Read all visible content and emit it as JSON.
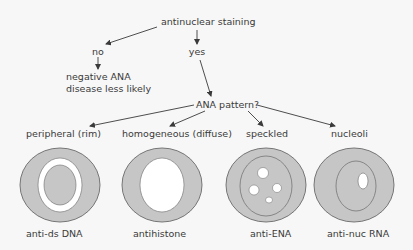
{
  "diagram": {
    "root": "antinuclear staining",
    "branch_no": "no",
    "branch_yes": "yes",
    "no_result_line1": "negative ANA",
    "no_result_line2": "disease less likely",
    "question": "ANA pattern?",
    "patterns": [
      {
        "name": "peripheral (rim)",
        "antibody": "anti-ds DNA",
        "icon": "rim-stain-cell-icon"
      },
      {
        "name": "homogeneous (diffuse)",
        "antibody": "antihistone",
        "icon": "homogeneous-stain-cell-icon"
      },
      {
        "name": "speckled",
        "antibody": "anti-ENA",
        "icon": "speckled-stain-cell-icon"
      },
      {
        "name": "nucleoli",
        "antibody": "anti-nuc RNA",
        "icon": "nucleolar-stain-cell-icon"
      }
    ]
  },
  "colors": {
    "background": "#f7f7f7",
    "text": "#3a3a3a",
    "cell_fill": "#c6c6c6",
    "cell_outline": "#6a6a6a",
    "unstained": "#ffffff"
  }
}
